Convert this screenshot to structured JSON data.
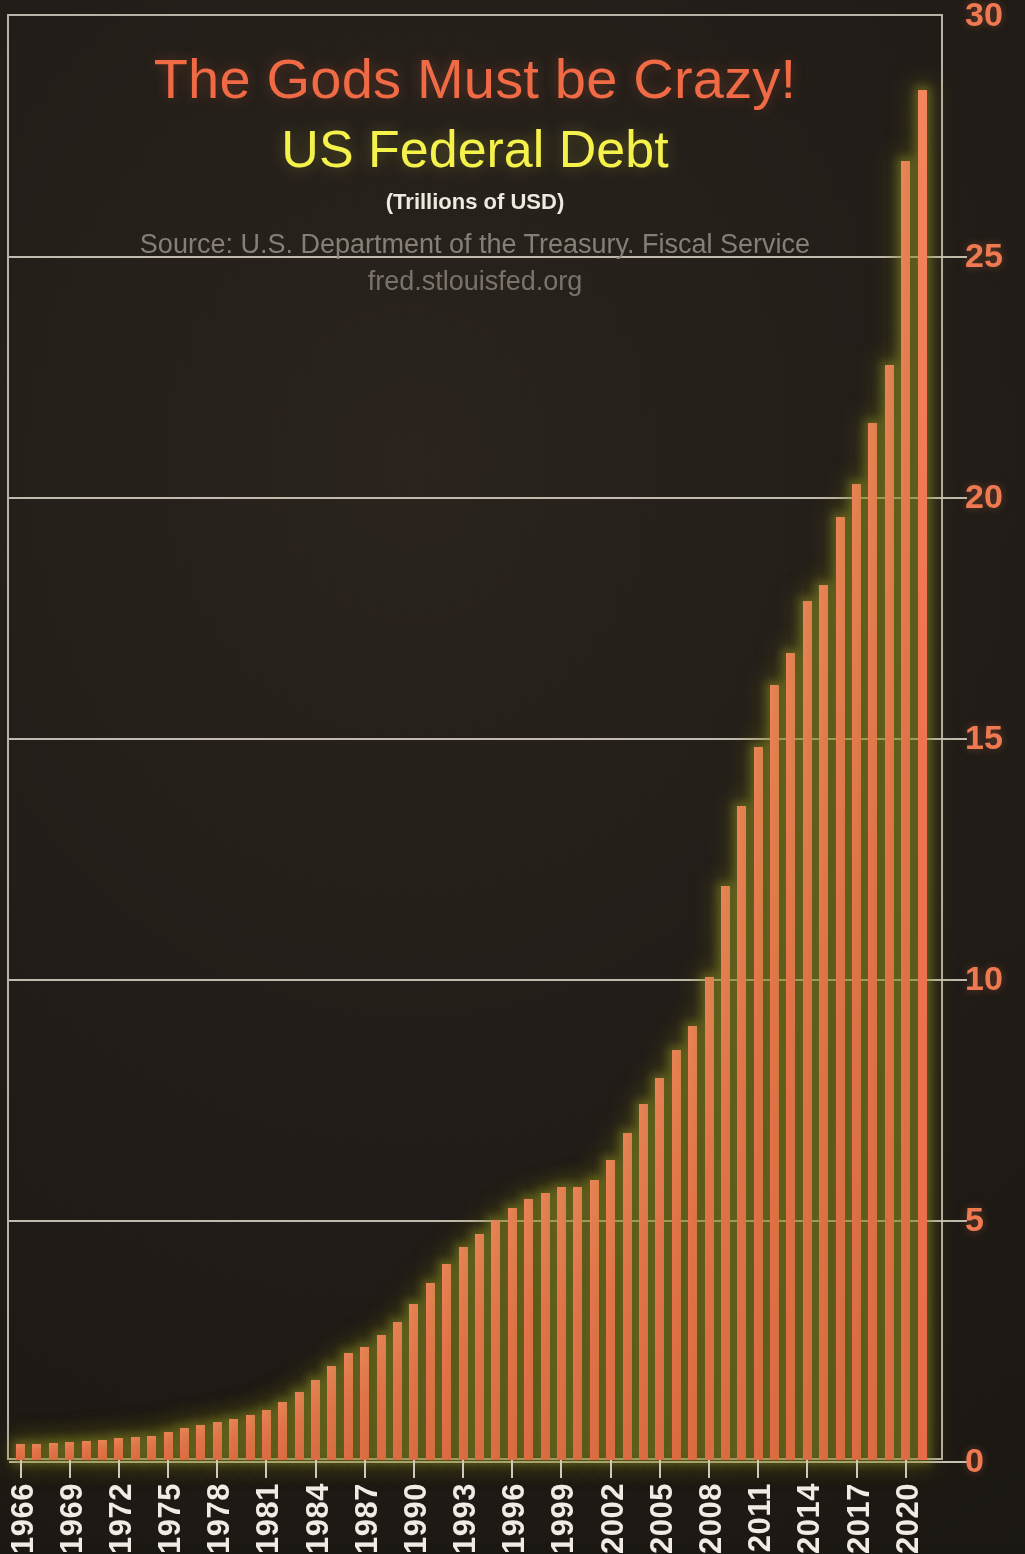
{
  "poster": {
    "title_main": "The Gods Must be Crazy!",
    "title_sub": "US Federal Debt",
    "units": "(Trillions of USD)",
    "source": "Source: U.S. Department of the Treasury. Fiscal Service",
    "url": "fred.stlouisfed.org",
    "colors": {
      "background": "#221d18",
      "bar": "#ef7450",
      "bar_glow": "#969628",
      "title_main": "#ef6a45",
      "title_sub": "#f5f24b",
      "units_text": "#efeae0",
      "source_text": "#8e887e",
      "grid": "#cfc8bb",
      "y_tick_text": "#ef7a52",
      "x_tick_text": "#f0ece4"
    }
  },
  "chart_data": {
    "type": "bar",
    "title": "The Gods Must be Crazy! US Federal Debt",
    "subtitle": "(Trillions of USD)",
    "xlabel": "",
    "ylabel": "",
    "ylim": [
      0,
      30
    ],
    "yticks": [
      0,
      5,
      10,
      15,
      20,
      25,
      30
    ],
    "ytick_labels": [
      "0",
      "5",
      "10",
      "15",
      "20",
      "25",
      "30"
    ],
    "grid": true,
    "legend": "none",
    "annotations": [
      "Source: U.S. Department of the Treasury. Fiscal Service",
      "fred.stlouisfed.org"
    ],
    "xtick_labels": [
      "1966",
      "1969",
      "1972",
      "1975",
      "1978",
      "1981",
      "1984",
      "1987",
      "1990",
      "1993",
      "1996",
      "1999",
      "2002",
      "2005",
      "2008",
      "2011",
      "2014",
      "2017",
      "2020"
    ],
    "xtick_interval_years": 3,
    "categories": [
      "1966",
      "1967",
      "1968",
      "1969",
      "1970",
      "1971",
      "1972",
      "1973",
      "1974",
      "1975",
      "1976",
      "1977",
      "1978",
      "1979",
      "1980",
      "1981",
      "1982",
      "1983",
      "1984",
      "1985",
      "1986",
      "1987",
      "1988",
      "1989",
      "1990",
      "1991",
      "1992",
      "1993",
      "1994",
      "1995",
      "1996",
      "1997",
      "1998",
      "1999",
      "2000",
      "2001",
      "2002",
      "2003",
      "2004",
      "2005",
      "2006",
      "2007",
      "2008",
      "2009",
      "2010",
      "2011",
      "2012",
      "2013",
      "2014",
      "2015",
      "2016",
      "2017",
      "2018",
      "2019",
      "2020",
      "2021"
    ],
    "values": [
      0.33,
      0.34,
      0.36,
      0.37,
      0.39,
      0.42,
      0.45,
      0.47,
      0.5,
      0.58,
      0.66,
      0.72,
      0.79,
      0.85,
      0.93,
      1.03,
      1.21,
      1.41,
      1.66,
      1.95,
      2.21,
      2.35,
      2.6,
      2.87,
      3.23,
      3.67,
      4.07,
      4.41,
      4.69,
      4.97,
      5.22,
      5.41,
      5.53,
      5.66,
      5.67,
      5.81,
      6.23,
      6.78,
      7.38,
      7.93,
      8.51,
      9.01,
      10.02,
      11.91,
      13.56,
      14.79,
      16.07,
      16.74,
      17.82,
      18.15,
      19.57,
      20.24,
      21.52,
      22.72,
      26.95,
      28.43
    ]
  }
}
